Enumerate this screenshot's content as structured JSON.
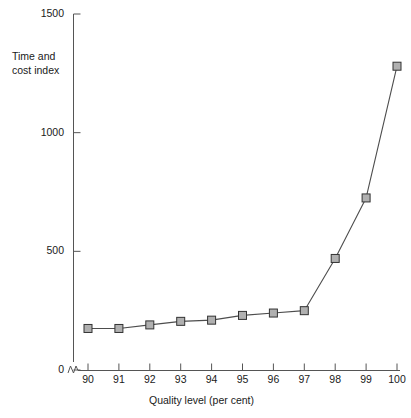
{
  "chart_data": {
    "type": "line",
    "title": "",
    "xlabel": "Quality level (per cent)",
    "ylabel": "Time and\ncost index",
    "categories": [
      90,
      91,
      92,
      93,
      94,
      95,
      96,
      97,
      98,
      99,
      100
    ],
    "x": [
      90,
      91,
      92,
      93,
      94,
      95,
      96,
      97,
      98,
      99,
      100
    ],
    "values": [
      175,
      175,
      190,
      205,
      210,
      230,
      240,
      250,
      470,
      725,
      1280
    ],
    "series": [
      {
        "name": "Time and cost index",
        "values": [
          175,
          175,
          190,
          205,
          210,
          230,
          240,
          250,
          470,
          725,
          1280
        ]
      }
    ],
    "xlim": [
      90,
      100
    ],
    "ylim": [
      0,
      1500
    ],
    "xticks": [
      "90",
      "91",
      "92",
      "93",
      "94",
      "95",
      "96",
      "97",
      "98",
      "99",
      "100"
    ],
    "yticks": [
      "0",
      "500",
      "1000",
      "1500"
    ],
    "ytick_values": [
      0,
      500,
      1000,
      1500
    ],
    "grid": false,
    "legend": false,
    "axis_break": true,
    "marker": "square",
    "colors": {
      "line": "#4d4d4d",
      "marker_fill": "#b0b0b0",
      "marker_edge": "#333333",
      "axis": "#555555",
      "text": "#1a1a1a",
      "background": "#ffffff"
    }
  }
}
